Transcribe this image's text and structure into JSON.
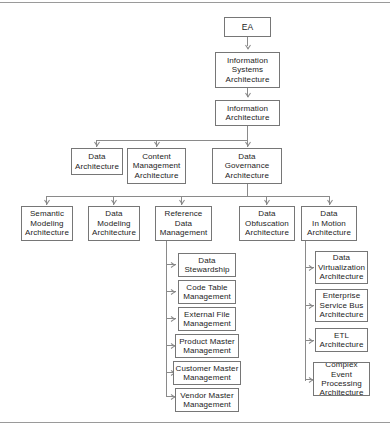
{
  "diagram": {
    "type": "hierarchy-tree",
    "colors": {
      "box_border": "#767676",
      "box_fill": "#ffffff",
      "connector": "#8a8a8a",
      "frame": "#9a9a9a",
      "text": "#1c1c1c"
    },
    "levels": [
      {
        "level": 1,
        "nodes": [
          {
            "id": "ea",
            "label": "EA"
          }
        ]
      },
      {
        "level": 2,
        "nodes": [
          {
            "id": "isa",
            "label": "Information\nSystems\nArchitecture",
            "parent": "ea"
          }
        ]
      },
      {
        "level": 3,
        "nodes": [
          {
            "id": "ia",
            "label": "Information\nArchitecture",
            "parent": "isa"
          }
        ]
      },
      {
        "level": 4,
        "nodes": [
          {
            "id": "da",
            "label": "Data\nArchitecture",
            "parent": "ia"
          },
          {
            "id": "cma",
            "label": "Content\nManagement\nArchitecture",
            "parent": "ia"
          },
          {
            "id": "dga",
            "label": "Data\nGovernance\nArchitecture",
            "parent": "ia"
          }
        ]
      },
      {
        "level": 5,
        "nodes": [
          {
            "id": "sma",
            "label": "Semantic\nModeling\nArchitecture",
            "parent": "dga"
          },
          {
            "id": "dma",
            "label": "Data\nModeling\nArchitecture",
            "parent": "dga"
          },
          {
            "id": "rdm",
            "label": "Reference\nData\nManagement",
            "parent": "dga"
          },
          {
            "id": "doa",
            "label": "Data\nObfuscation\nArchitecture",
            "parent": "dga"
          },
          {
            "id": "dima",
            "label": "Data\nIn Motion\nArchitecture",
            "parent": "dga"
          }
        ]
      },
      {
        "level": 6,
        "nodes": [
          {
            "id": "ds",
            "label": "Data\nStewardship",
            "parent": "rdm"
          },
          {
            "id": "ctm",
            "label": "Code Table\nManagement",
            "parent": "rdm"
          },
          {
            "id": "efm",
            "label": "External File\nManagement",
            "parent": "rdm"
          },
          {
            "id": "pmm",
            "label": "Product Master\nManagement",
            "parent": "rdm"
          },
          {
            "id": "cmm",
            "label": "Customer Master\nManagement",
            "parent": "rdm"
          },
          {
            "id": "vmm",
            "label": "Vendor Master\nManagement",
            "parent": "rdm"
          },
          {
            "id": "dva",
            "label": "Data\nVirtualization\nArchitecture",
            "parent": "dima"
          },
          {
            "id": "esba",
            "label": "Enterprise\nService Bus\nArchitecture",
            "parent": "dima"
          },
          {
            "id": "etla",
            "label": "ETL\nArchitecture",
            "parent": "dima"
          },
          {
            "id": "cepa",
            "label": "Complex Event\nProcessing\nArchitecture",
            "parent": "dima"
          }
        ]
      }
    ]
  }
}
